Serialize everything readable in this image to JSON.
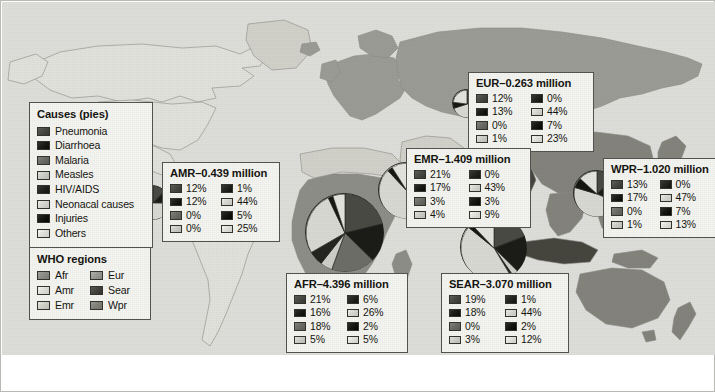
{
  "figure": {
    "background_color": "#dededa",
    "border_color": "#b9b9b4"
  },
  "causes_legend": {
    "title": "Causes (pies)",
    "items": [
      {
        "label": "Pneumonia",
        "color": "#4a4a45",
        "key": "pneumonia"
      },
      {
        "label": "Diarrhoea",
        "color": "#1b1b18",
        "key": "diarrhoea"
      },
      {
        "label": "Malaria",
        "color": "#6e6e68",
        "key": "malaria"
      },
      {
        "label": "Measles",
        "color": "#cfcfc9",
        "key": "measles"
      },
      {
        "label": "HIV/AIDS",
        "color": "#242420",
        "key": "hiv_aids"
      },
      {
        "label": "Neonacal causes",
        "color": "#d9d9d3",
        "key": "neonatal_causes"
      },
      {
        "label": "Injuries",
        "color": "#161613",
        "key": "injuries"
      },
      {
        "label": "Others",
        "color": "#e4e4de",
        "key": "others"
      }
    ]
  },
  "who_legend": {
    "title": "WHO regions",
    "items": [
      {
        "label": "Afr",
        "color": "#8e8e88"
      },
      {
        "label": "Eur",
        "color": "#9c9c96"
      },
      {
        "label": "Amr",
        "color": "#e2e2dc"
      },
      {
        "label": "Sear",
        "color": "#46463f"
      },
      {
        "label": "Emr",
        "color": "#d2d2cb"
      },
      {
        "label": "Wpr",
        "color": "#84847d"
      }
    ]
  },
  "chart_data": {
    "type": "pie",
    "categories": [
      "Pneumonia",
      "Diarrhoea",
      "Malaria",
      "Measles",
      "HIV/AIDS",
      "Neonacal causes",
      "Injuries",
      "Others"
    ],
    "colors": [
      "#4a4a45",
      "#1b1b18",
      "#6e6e68",
      "#cfcfc9",
      "#242420",
      "#d9d9d3",
      "#161613",
      "#e4e4de"
    ],
    "unit": "million",
    "regions": [
      {
        "code": "AMR",
        "title": "AMR–0.439 million",
        "total": 0.439,
        "values": [
          12,
          12,
          0,
          0,
          1,
          44,
          5,
          25
        ],
        "labels": [
          "12%",
          "12%",
          "0%",
          "0%",
          "1%",
          "44%",
          "5%",
          "25%"
        ],
        "pie": {
          "cx": 150,
          "cy": 200,
          "r": 17,
          "start_angle": -90
        }
      },
      {
        "code": "EUR",
        "title": "EUR–0.263 million",
        "total": 0.263,
        "values": [
          12,
          13,
          0,
          1,
          0,
          44,
          7,
          23
        ],
        "labels": [
          "12%",
          "13%",
          "0%",
          "1%",
          "0%",
          "44%",
          "7%",
          "23%"
        ],
        "pie": {
          "cx": 464,
          "cy": 101,
          "r": 14,
          "start_angle": -90
        }
      },
      {
        "code": "EMR",
        "title": "EMR–1.409 million",
        "total": 1.409,
        "values": [
          21,
          17,
          3,
          4,
          0,
          43,
          3,
          9
        ],
        "labels": [
          "21%",
          "17%",
          "3%",
          "4%",
          "0%",
          "43%",
          "3%",
          "9%"
        ],
        "pie": {
          "cx": 404,
          "cy": 188,
          "r": 28,
          "start_angle": -90
        }
      },
      {
        "code": "WPR",
        "title": "WPR–1.020 million",
        "total": 1.02,
        "values": [
          13,
          17,
          0,
          1,
          0,
          47,
          7,
          13
        ],
        "labels": [
          "13%",
          "17%",
          "0%",
          "1%",
          "0%",
          "47%",
          "7%",
          "13%"
        ],
        "pie": {
          "cx": 594,
          "cy": 191,
          "r": 23,
          "start_angle": -90
        }
      },
      {
        "code": "AFR",
        "title": "AFR–4.396 million",
        "total": 4.396,
        "values": [
          21,
          16,
          18,
          5,
          6,
          26,
          2,
          5
        ],
        "labels": [
          "21%",
          "16%",
          "18%",
          "5%",
          "6%",
          "26%",
          "2%",
          "5%"
        ],
        "pie": {
          "cx": 342,
          "cy": 230,
          "r": 39,
          "start_angle": -90
        }
      },
      {
        "code": "SEAR",
        "title": "SEAR–3.070 million",
        "total": 3.07,
        "values": [
          19,
          18,
          0,
          3,
          1,
          44,
          2,
          12
        ],
        "labels": [
          "19%",
          "18%",
          "0%",
          "3%",
          "1%",
          "44%",
          "2%",
          "12%"
        ],
        "pie": {
          "cx": 491,
          "cy": 245,
          "r": 33,
          "start_angle": -90
        }
      }
    ]
  }
}
